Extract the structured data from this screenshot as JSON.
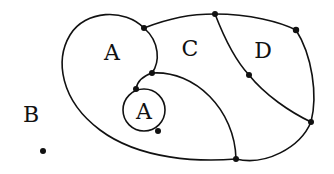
{
  "diagram": {
    "type": "planar-map",
    "regions": [
      {
        "id": "A-outer",
        "label": "A",
        "x": 112,
        "y": 52
      },
      {
        "id": "C",
        "label": "C",
        "x": 190,
        "y": 48
      },
      {
        "id": "D",
        "label": "D",
        "x": 263,
        "y": 50
      },
      {
        "id": "A-inner",
        "label": "A",
        "x": 144,
        "y": 111
      },
      {
        "id": "B",
        "label": "B",
        "x": 31,
        "y": 114
      }
    ],
    "isolated_point": {
      "x": 43,
      "y": 151
    },
    "nodes": [
      {
        "id": "n1",
        "x": 144,
        "y": 28
      },
      {
        "id": "n2",
        "x": 152,
        "y": 73
      },
      {
        "id": "n3",
        "x": 136,
        "y": 89
      },
      {
        "id": "n4",
        "x": 158,
        "y": 131
      },
      {
        "id": "n5",
        "x": 215,
        "y": 14
      },
      {
        "id": "n6",
        "x": 296,
        "y": 30
      },
      {
        "id": "n7",
        "x": 249,
        "y": 75
      },
      {
        "id": "n8",
        "x": 311,
        "y": 122
      },
      {
        "id": "n9",
        "x": 236,
        "y": 159
      }
    ],
    "colors": {
      "stroke": "#111111",
      "background": "#ffffff"
    }
  }
}
